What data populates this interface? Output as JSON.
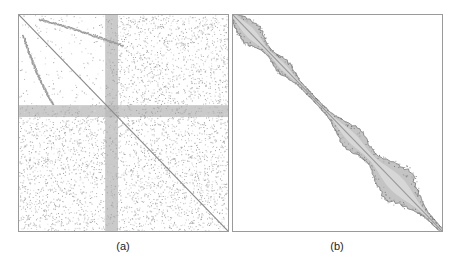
{
  "figure": {
    "panels": [
      {
        "id": "a",
        "caption": "(a)",
        "description": "Sparsity pattern of unordered matrix: scattered nonzeros, main diagonal, dense cross band",
        "diagonal_color": "#8a8a8a",
        "band_color": "#b8b8b8",
        "dot_color": "#a8a8a8"
      },
      {
        "id": "b",
        "caption": "(b)",
        "description": "Sparsity pattern after bandwidth-reducing reordering: nonzeros concentrated along diagonal band",
        "diagonal_color": "#9a9a9a",
        "band_fill_color": "#c4c4c4",
        "band_edge_color": "#7a7a7a"
      }
    ]
  }
}
